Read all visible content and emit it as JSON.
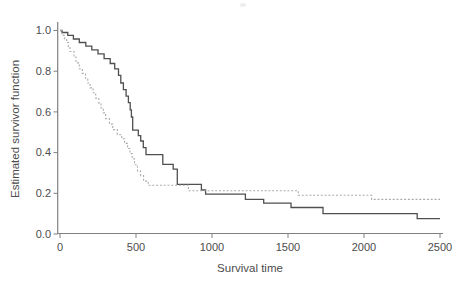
{
  "chart_data": {
    "type": "line",
    "subtype": "kaplan-meier-step-functions",
    "title": "",
    "xlabel": "Survival time",
    "ylabel": "Estimated survivor function",
    "xlim": [
      0,
      2500
    ],
    "ylim": [
      0.0,
      1.0
    ],
    "x_ticks": [
      0,
      500,
      1000,
      1500,
      2000,
      2500
    ],
    "y_ticks": [
      1.0,
      0.8,
      0.6,
      0.4,
      0.2,
      0.0
    ],
    "grid": false,
    "legend_position": "none",
    "axis_color": "#808080",
    "text_color": "#4c4c4c",
    "series": [
      {
        "name": "group-1-solid",
        "style": "solid",
        "color": "#4f4f4f",
        "t_end": 2500,
        "points": [
          [
            0,
            1.0
          ],
          [
            13,
            0.99
          ],
          [
            51,
            0.976
          ],
          [
            88,
            0.958
          ],
          [
            127,
            0.941
          ],
          [
            170,
            0.923
          ],
          [
            209,
            0.905
          ],
          [
            250,
            0.885
          ],
          [
            290,
            0.862
          ],
          [
            330,
            0.838
          ],
          [
            360,
            0.812
          ],
          [
            385,
            0.78
          ],
          [
            400,
            0.742
          ],
          [
            417,
            0.709
          ],
          [
            435,
            0.677
          ],
          [
            450,
            0.645
          ],
          [
            462,
            0.61
          ],
          [
            470,
            0.575
          ],
          [
            478,
            0.51
          ],
          [
            515,
            0.483
          ],
          [
            531,
            0.457
          ],
          [
            548,
            0.424
          ],
          [
            566,
            0.39
          ],
          [
            676,
            0.342
          ],
          [
            745,
            0.319
          ],
          [
            772,
            0.244
          ],
          [
            930,
            0.216
          ],
          [
            958,
            0.196
          ],
          [
            1220,
            0.17
          ],
          [
            1340,
            0.152
          ],
          [
            1520,
            0.13
          ],
          [
            1730,
            0.1
          ],
          [
            2350,
            0.075
          ]
        ]
      },
      {
        "name": "group-2-dotted",
        "style": "dotted",
        "color": "#ababab",
        "t_end": 2500,
        "points": [
          [
            0,
            1.0
          ],
          [
            13,
            0.976
          ],
          [
            31,
            0.958
          ],
          [
            44,
            0.941
          ],
          [
            55,
            0.92
          ],
          [
            66,
            0.897
          ],
          [
            92,
            0.87
          ],
          [
            105,
            0.841
          ],
          [
            127,
            0.812
          ],
          [
            147,
            0.789
          ],
          [
            168,
            0.765
          ],
          [
            183,
            0.742
          ],
          [
            198,
            0.718
          ],
          [
            218,
            0.694
          ],
          [
            235,
            0.668
          ],
          [
            255,
            0.644
          ],
          [
            270,
            0.619
          ],
          [
            285,
            0.595
          ],
          [
            300,
            0.567
          ],
          [
            325,
            0.54
          ],
          [
            347,
            0.513
          ],
          [
            377,
            0.488
          ],
          [
            406,
            0.468
          ],
          [
            425,
            0.445
          ],
          [
            445,
            0.42
          ],
          [
            460,
            0.395
          ],
          [
            475,
            0.37
          ],
          [
            490,
            0.34
          ],
          [
            510,
            0.31
          ],
          [
            530,
            0.287
          ],
          [
            550,
            0.26
          ],
          [
            580,
            0.24
          ],
          [
            845,
            0.213
          ],
          [
            1568,
            0.19
          ],
          [
            2050,
            0.17
          ]
        ]
      }
    ]
  }
}
